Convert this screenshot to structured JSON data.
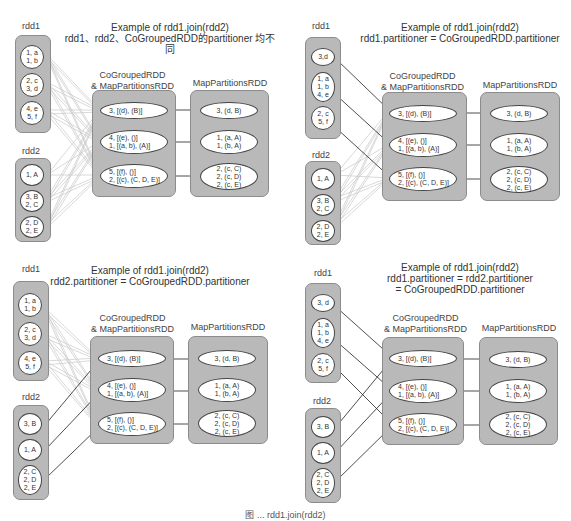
{
  "labels": {
    "rdd1": "rdd1",
    "rdd2": "rdd2",
    "cogrouped": "CoGroupedRDD\n& MapPartitionsRDD",
    "mappartitions": "MapPartitionsRDD"
  },
  "panels": [
    {
      "title": "Example of rdd1.join(rdd2)\nrdd1、rdd2、CoGroupedRDD的partitioner 均不同",
      "rdd1": [
        "1, a\n1, b",
        "2, c\n3, d",
        "4, e\n5, f"
      ],
      "rdd2": [
        "1, A",
        "3, B\n2, C",
        "2, D\n2, E"
      ],
      "cogrouped": [
        "3, [(d), (B)]",
        "4, [(e), ()]\n1, [(a, b), (A)]",
        "5, [(f), ()]\n2, [(c), (C, D, E)]"
      ],
      "mappartitions": [
        "3, (d, B)",
        "1, (a, A)\n1, (b, A)",
        "2, (c, C)\n2, (c, D)\n2, (c, E)"
      ]
    },
    {
      "title": "Example of rdd1.join(rdd2)\nrdd1.partitioner = CoGroupedRDD.partitioner",
      "rdd1": [
        "3,d",
        "1, a\n1, b\n4, e",
        "2, c\n5, f"
      ],
      "rdd2": [
        "1, A",
        "3, B\n2, C",
        "2, D\n2, E"
      ],
      "cogrouped": [
        "3, [(d), (B)]",
        "4, [(e), ()]\n1, [(a, b), (A)]",
        "5, [(f), ()]\n2, [(c), (C, D, E)]"
      ],
      "mappartitions": [
        "3, (d, B)",
        "1, (a, A)\n1, (b, A)",
        "2, (c, C)\n2, (c, D)\n2, (c, E)"
      ]
    },
    {
      "title": "Example of rdd1.join(rdd2)\nrdd2.partitioner = CoGroupedRDD.partitioner",
      "rdd1": [
        "1, a\n1, b",
        "2, c\n3, d",
        "4, e\n5, f"
      ],
      "rdd2": [
        "3, B",
        "1, A",
        "2, C\n2, D\n2, E"
      ],
      "cogrouped": [
        "3, [(d), (B)]",
        "4, [(e), ()]\n1, [(a, b), (A)]",
        "5, [(f), ()]\n2, [(c), (C, D, E)]"
      ],
      "mappartitions": [
        "3, (d, B)",
        "1, (a, A)\n1, (b, A)",
        "2, (c, C)\n2, (c, D)\n2, (c, E)"
      ]
    },
    {
      "title": "Example of rdd1.join(rdd2)\nrdd1.partitioner = rdd2.partitioner\n= CoGroupedRDD.partitioner",
      "rdd1": [
        "3, d",
        "1, a\n1, b\n4, e",
        "2, c\n5, f"
      ],
      "rdd2": [
        "3, B",
        "1, A",
        "2, C\n2, D\n2, E"
      ],
      "cogrouped": [
        "3, [(d), (B)]",
        "4, [(e), ()]\n1, [(a, b), (A)]",
        "5, [(f), ()]\n2, [(c), (C, D, E)]"
      ],
      "mappartitions": [
        "3, (d, B)",
        "1, (a, A)\n1, (b, A)",
        "2, (c, C)\n2, (c, D)\n2, (c, E)"
      ]
    }
  ],
  "caption": "图 ... rdd1.join(rdd2)"
}
